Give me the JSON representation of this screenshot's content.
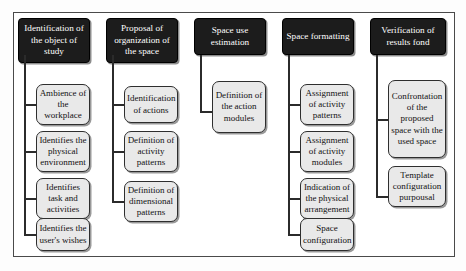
{
  "figure": {
    "type": "flowchart-columns",
    "background_color": "#ffffff",
    "frame_color": "#4a4a4a",
    "header_fill": "#1c1c1c",
    "header_text_color": "#ffffff",
    "node_fill": "#e9e9e9",
    "node_border_color": "#2e2e2e",
    "connector_color": "#2b2b2b"
  },
  "columns": [
    {
      "id": "col-1",
      "header": "Identification of the object of study",
      "nodes": [
        {
          "label": "Ambience of the workplace"
        },
        {
          "label": "Identifies the physical environment"
        },
        {
          "label": "Identifies task and activities"
        },
        {
          "label": "Identifies the user's wishes"
        }
      ]
    },
    {
      "id": "col-2",
      "header": "Proposal of organization of the space",
      "nodes": [
        {
          "label": "Identification of actions"
        },
        {
          "label": "Definition of activity patterns"
        },
        {
          "label": "Definition of dimensional patterns"
        }
      ]
    },
    {
      "id": "col-3",
      "header": "Space use estimation",
      "nodes": [
        {
          "label": "Definition of the action modules"
        }
      ]
    },
    {
      "id": "col-4",
      "header": "Space formatting",
      "nodes": [
        {
          "label": "Assignment of activity patterns"
        },
        {
          "label": "Assignment of activity modules"
        },
        {
          "label": "Indication of the physical arrangement"
        },
        {
          "label": "Space configuration"
        }
      ]
    },
    {
      "id": "col-5",
      "header": "Verification of results fond",
      "nodes": [
        {
          "label": "Confrontation of the proposed space with the used space"
        },
        {
          "label": "Template configuration purpousal"
        }
      ]
    }
  ]
}
